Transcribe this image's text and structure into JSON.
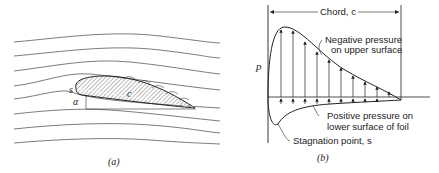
{
  "panel_a": {
    "caption": "(a)",
    "labels": {
      "stagnation": "s",
      "angle": "α",
      "chord": "c"
    }
  },
  "panel_b": {
    "caption": "(b)",
    "axis_label": "p",
    "chord_label": "Chord, c",
    "annotations": {
      "negative_line1": "Negative pressure",
      "negative_line2": "on upper surface",
      "positive_line1": "Positive pressure on",
      "positive_line2": "lower surface of foil",
      "stagnation": "Stagnation point, s"
    }
  }
}
